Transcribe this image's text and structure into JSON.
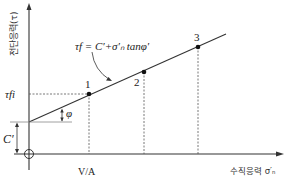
{
  "diagram": {
    "type": "mohr-coulomb-failure-envelope",
    "y_axis_label": "전단응력(τ)",
    "x_axis_label": "수직응력 σ′ₙ",
    "equation": "τf = C′+σ′ₙ tanφ′",
    "tau_fi_label": "τfi",
    "cohesion_label": "C′",
    "angle_label": "φ",
    "x_tick_label": "V/A",
    "points": [
      {
        "label": "1"
      },
      {
        "label": "2"
      },
      {
        "label": "3"
      }
    ],
    "colors": {
      "line": "#333333",
      "background": "#ffffff"
    }
  }
}
